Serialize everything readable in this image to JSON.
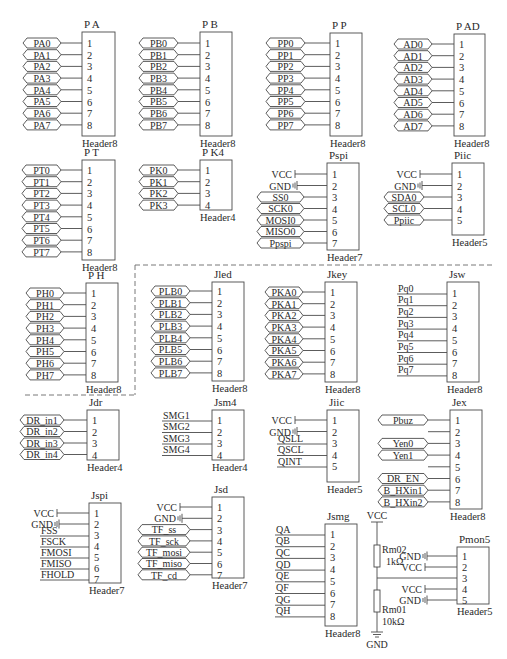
{
  "colors": {
    "line": "#4a4a4a",
    "text": "#2a2a2a",
    "background": "#ffffff",
    "dashed": "#6a6a6a"
  },
  "connectors": [
    {
      "id": "PA",
      "title": "P A",
      "part": "Header8",
      "box": [
        82,
        32,
        33,
        104
      ],
      "pin_y0": 43,
      "pin_dy": 11.7,
      "nets": [
        {
          "label": "PA0",
          "style": "port"
        },
        {
          "label": "PA1",
          "style": "port"
        },
        {
          "label": "PA2",
          "style": "port"
        },
        {
          "label": "PA3",
          "style": "port"
        },
        {
          "label": "PA4",
          "style": "port"
        },
        {
          "label": "PA5",
          "style": "port"
        },
        {
          "label": "PA6",
          "style": "port"
        },
        {
          "label": "PA7",
          "style": "port"
        }
      ],
      "port_x": [
        23,
        61
      ]
    },
    {
      "id": "PB",
      "title": "P B",
      "part": "Header8",
      "box": [
        200,
        32,
        32,
        104
      ],
      "pin_y0": 43,
      "pin_dy": 11.7,
      "nets": [
        {
          "label": "PB0",
          "style": "port"
        },
        {
          "label": "PB1",
          "style": "port"
        },
        {
          "label": "PB2",
          "style": "port"
        },
        {
          "label": "PB3",
          "style": "port"
        },
        {
          "label": "PB4",
          "style": "port"
        },
        {
          "label": "PB5",
          "style": "port"
        },
        {
          "label": "PB6",
          "style": "port"
        },
        {
          "label": "PB7",
          "style": "port"
        }
      ],
      "port_x": [
        139,
        178
      ]
    },
    {
      "id": "PP",
      "title": "P P",
      "part": "Header8",
      "box": [
        330,
        33,
        32,
        103
      ],
      "pin_y0": 43,
      "pin_dy": 11.7,
      "nets": [
        {
          "label": "PP0",
          "style": "port"
        },
        {
          "label": "PP1",
          "style": "port"
        },
        {
          "label": "PP2",
          "style": "port"
        },
        {
          "label": "PP3",
          "style": "port"
        },
        {
          "label": "PP4",
          "style": "port"
        },
        {
          "label": "PP5",
          "style": "port"
        },
        {
          "label": "PP6",
          "style": "port"
        },
        {
          "label": "PP7",
          "style": "port"
        }
      ],
      "port_x": [
        266,
        305
      ]
    },
    {
      "id": "PAD",
      "title": "P AD",
      "part": "Header8",
      "box": [
        454,
        34,
        31,
        102
      ],
      "pin_y0": 44,
      "pin_dy": 11.7,
      "nets": [
        {
          "label": "AD0",
          "style": "port"
        },
        {
          "label": "AD1",
          "style": "port"
        },
        {
          "label": "AD2",
          "style": "port"
        },
        {
          "label": "AD3",
          "style": "port"
        },
        {
          "label": "AD4",
          "style": "port"
        },
        {
          "label": "AD5",
          "style": "port"
        },
        {
          "label": "AD6",
          "style": "port"
        },
        {
          "label": "AD7",
          "style": "port"
        }
      ],
      "port_x": [
        394,
        432
      ]
    },
    {
      "id": "PT",
      "title": "P T",
      "part": "Header8",
      "box": [
        82,
        160,
        33,
        100
      ],
      "pin_y0": 170,
      "pin_dy": 11.7,
      "nets": [
        {
          "label": "PT0",
          "style": "port"
        },
        {
          "label": "PT1",
          "style": "port"
        },
        {
          "label": "PT2",
          "style": "port"
        },
        {
          "label": "PT3",
          "style": "port"
        },
        {
          "label": "PT4",
          "style": "port"
        },
        {
          "label": "PT5",
          "style": "port"
        },
        {
          "label": "PT6",
          "style": "port"
        },
        {
          "label": "PT7",
          "style": "port"
        }
      ],
      "port_x": [
        22,
        61
      ]
    },
    {
      "id": "PK4",
      "title": "P K4",
      "part": "Header4",
      "box": [
        200,
        160,
        32,
        50
      ],
      "pin_y0": 170,
      "pin_dy": 11.7,
      "nets": [
        {
          "label": "PK0",
          "style": "port"
        },
        {
          "label": "PK1",
          "style": "port"
        },
        {
          "label": "PK2",
          "style": "port"
        },
        {
          "label": "PK3",
          "style": "port"
        }
      ],
      "port_x": [
        139,
        178
      ]
    },
    {
      "id": "Pspi",
      "title": "Pspi",
      "part": "Header7",
      "box": [
        327,
        163,
        32,
        87
      ],
      "pin_y0": 174,
      "pin_dy": 11.5,
      "nets": [
        {
          "label": "VCC",
          "style": "vcc"
        },
        {
          "label": "GND",
          "style": "gnd"
        },
        {
          "label": "SS0",
          "style": "port"
        },
        {
          "label": "SCK0",
          "style": "port"
        },
        {
          "label": "MOSI0",
          "style": "port"
        },
        {
          "label": "MISO0",
          "style": "port"
        },
        {
          "label": "Ppspi",
          "style": "port"
        }
      ],
      "port_x": [
        257,
        304
      ]
    },
    {
      "id": "Piic",
      "title": "Piic",
      "part": "Header5",
      "box": [
        452,
        163,
        32,
        72
      ],
      "pin_y0": 174,
      "pin_dy": 11.5,
      "nets": [
        {
          "label": "VCC",
          "style": "vcc"
        },
        {
          "label": "GND",
          "style": "gnd"
        },
        {
          "label": "SDA0",
          "style": "port"
        },
        {
          "label": "SCL0",
          "style": "port"
        },
        {
          "label": "Ppiic",
          "style": "port"
        }
      ],
      "port_x": [
        384,
        424
      ]
    },
    {
      "id": "PH",
      "title": "P H",
      "part": "Header8",
      "box": [
        86,
        283,
        32,
        99
      ],
      "pin_y0": 293,
      "pin_dy": 11.7,
      "nets": [
        {
          "label": "PH0",
          "style": "port"
        },
        {
          "label": "PH1",
          "style": "port"
        },
        {
          "label": "PH2",
          "style": "port"
        },
        {
          "label": "PH3",
          "style": "port"
        },
        {
          "label": "PH4",
          "style": "port"
        },
        {
          "label": "PH5",
          "style": "port"
        },
        {
          "label": "PH6",
          "style": "port"
        },
        {
          "label": "PH7",
          "style": "port"
        }
      ],
      "port_x": [
        26,
        64
      ]
    },
    {
      "id": "Jled",
      "title": "Jled",
      "part": "Header8",
      "box": [
        212,
        282,
        32,
        99
      ],
      "pin_y0": 291,
      "pin_dy": 11.7,
      "nets": [
        {
          "label": "PLB0",
          "style": "port"
        },
        {
          "label": "PLB1",
          "style": "port"
        },
        {
          "label": "PLB2",
          "style": "port"
        },
        {
          "label": "PLB3",
          "style": "port"
        },
        {
          "label": "PLB4",
          "style": "port"
        },
        {
          "label": "PLB5",
          "style": "port"
        },
        {
          "label": "PLB6",
          "style": "port"
        },
        {
          "label": "PLB7",
          "style": "port"
        }
      ],
      "port_x": [
        151,
        190
      ]
    },
    {
      "id": "Jkey",
      "title": "Jkey",
      "part": "Header8",
      "box": [
        325,
        282,
        32,
        100
      ],
      "pin_y0": 292,
      "pin_dy": 11.7,
      "nets": [
        {
          "label": "PKA0",
          "style": "port"
        },
        {
          "label": "PKA1",
          "style": "port"
        },
        {
          "label": "PKA2",
          "style": "port"
        },
        {
          "label": "PKA3",
          "style": "port"
        },
        {
          "label": "PKA4",
          "style": "port"
        },
        {
          "label": "PKA5",
          "style": "port"
        },
        {
          "label": "PKA6",
          "style": "port"
        },
        {
          "label": "PKA7",
          "style": "port"
        }
      ],
      "port_x": [
        265,
        303
      ]
    },
    {
      "id": "Jsw",
      "title": "Jsw",
      "part": "Header8",
      "box": [
        447,
        282,
        32,
        100
      ],
      "pin_y0": 293,
      "pin_dy": 11.7,
      "nets": [
        {
          "label": "Pq0",
          "style": "wire"
        },
        {
          "label": "Pq1",
          "style": "wire"
        },
        {
          "label": "Pq2",
          "style": "wire"
        },
        {
          "label": "Pq3",
          "style": "wire"
        },
        {
          "label": "Pq4",
          "style": "wire"
        },
        {
          "label": "Pq5",
          "style": "wire"
        },
        {
          "label": "Pq6",
          "style": "wire"
        },
        {
          "label": "Pq7",
          "style": "wire"
        }
      ],
      "port_x": [
        397,
        430
      ]
    },
    {
      "id": "Jdr",
      "title": "Jdr",
      "part": "Header4",
      "box": [
        87,
        410,
        32,
        50
      ],
      "pin_y0": 420,
      "pin_dy": 11.5,
      "nets": [
        {
          "label": "DR_in1",
          "style": "port"
        },
        {
          "label": "DR_in2",
          "style": "port"
        },
        {
          "label": "DR_in3",
          "style": "port"
        },
        {
          "label": "DR_in4",
          "style": "port"
        }
      ],
      "port_x": [
        20,
        64
      ]
    },
    {
      "id": "Jsm4",
      "title": "Jsm4",
      "part": "Header4",
      "box": [
        212,
        410,
        32,
        50
      ],
      "pin_y0": 420,
      "pin_dy": 11.5,
      "nets": [
        {
          "label": "SMG1",
          "style": "wire"
        },
        {
          "label": "SMG2",
          "style": "wire"
        },
        {
          "label": "SMG3",
          "style": "wire"
        },
        {
          "label": "SMG4",
          "style": "wire"
        }
      ],
      "port_x": [
        162,
        190
      ]
    },
    {
      "id": "Jiic",
      "title": "Jiic",
      "part": "Header5",
      "box": [
        327,
        410,
        32,
        72
      ],
      "pin_y0": 420,
      "pin_dy": 11.5,
      "nets": [
        {
          "label": "VCC",
          "style": "vcc"
        },
        {
          "label": "GND",
          "style": "gnd"
        },
        {
          "label": "QSLL",
          "style": "wire"
        },
        {
          "label": "QSCL",
          "style": "wire"
        },
        {
          "label": "QINT",
          "style": "wire"
        }
      ],
      "port_x": [
        277,
        305
      ]
    },
    {
      "id": "Jex",
      "title": "Jex",
      "part": "Header8",
      "box": [
        450,
        410,
        32,
        99
      ],
      "pin_y0": 420,
      "pin_dy": 11.7,
      "nets": [
        {
          "label": "Pbuz",
          "style": "port"
        },
        {
          "label": "",
          "style": "stub"
        },
        {
          "label": "Yen0",
          "style": "port"
        },
        {
          "label": "Yen1",
          "style": "port"
        },
        {
          "label": "",
          "style": "stub"
        },
        {
          "label": "DR_EN",
          "style": "port"
        },
        {
          "label": "B_HXin1",
          "style": "port"
        },
        {
          "label": "B_HXin2",
          "style": "port"
        }
      ],
      "port_x": [
        378,
        428
      ]
    },
    {
      "id": "Jspi",
      "title": "Jspi",
      "part": "Header7",
      "box": [
        89,
        503,
        32,
        80
      ],
      "pin_y0": 513,
      "pin_dy": 11,
      "nets": [
        {
          "label": "VCC",
          "style": "vcc"
        },
        {
          "label": "GND",
          "style": "gnd"
        },
        {
          "label": "FSS",
          "style": "wire"
        },
        {
          "label": "FSCK",
          "style": "wire"
        },
        {
          "label": "FMOSI",
          "style": "wire"
        },
        {
          "label": "FMISO",
          "style": "wire"
        },
        {
          "label": "FHOLD",
          "style": "wire"
        }
      ],
      "port_x": [
        40,
        75
      ]
    },
    {
      "id": "Jsd",
      "title": "Jsd",
      "part": "Header7",
      "box": [
        212,
        497,
        32,
        81
      ],
      "pin_y0": 507,
      "pin_dy": 11.3,
      "nets": [
        {
          "label": "VCC",
          "style": "vcc"
        },
        {
          "label": "GND",
          "style": "gnd"
        },
        {
          "label": "TF_ss",
          "style": "port"
        },
        {
          "label": "TF_sck",
          "style": "port"
        },
        {
          "label": "TF_mosi",
          "style": "port"
        },
        {
          "label": "TF_miso",
          "style": "port"
        },
        {
          "label": "TF_cd",
          "style": "port"
        }
      ],
      "port_x": [
        138,
        190
      ]
    },
    {
      "id": "Jsmg",
      "title": "Jsmg",
      "part": "Header8",
      "box": [
        325,
        524,
        32,
        102
      ],
      "pin_y0": 534,
      "pin_dy": 11.7,
      "nets": [
        {
          "label": "QA",
          "style": "wire"
        },
        {
          "label": "QB",
          "style": "wire"
        },
        {
          "label": "QC",
          "style": "wire"
        },
        {
          "label": "QD",
          "style": "wire"
        },
        {
          "label": "QE",
          "style": "wire"
        },
        {
          "label": "QF",
          "style": "wire"
        },
        {
          "label": "QG",
          "style": "wire"
        },
        {
          "label": "QH",
          "style": "wire"
        }
      ],
      "port_x": [
        275,
        305
      ]
    },
    {
      "id": "Pmon5",
      "title": "Pmon5",
      "part": "Header5",
      "box": [
        457,
        547,
        32,
        57
      ],
      "pin_y0": 556,
      "pin_dy": 11,
      "nets": [
        {
          "label": "GND",
          "style": "gnd"
        },
        {
          "label": "VCC",
          "style": "vcc"
        },
        {
          "label": "",
          "style": "divider"
        },
        {
          "label": "VCC",
          "style": "vcc"
        },
        {
          "label": "GND",
          "style": "gnd"
        }
      ],
      "port_x": [
        430,
        445
      ]
    }
  ],
  "divider_circuit": {
    "vcc_label": "VCC",
    "gnd_label": "GND",
    "r_top": {
      "ref": "Rm02",
      "value": "1kΩ"
    },
    "r_bottom": {
      "ref": "Rm01",
      "value": "10kΩ"
    },
    "rail_x": 377,
    "vcc_y": 603,
    "top_y": 524,
    "mid_y": 578,
    "bottom_y": 638
  },
  "dashed_region": {
    "points": [
      [
        135,
        265
      ],
      [
        492,
        265
      ]
    ],
    "left_edge": [
      [
        135,
        265
      ],
      [
        135,
        395
      ]
    ],
    "bottom_edge": [
      [
        25,
        395
      ],
      [
        135,
        395
      ]
    ]
  }
}
